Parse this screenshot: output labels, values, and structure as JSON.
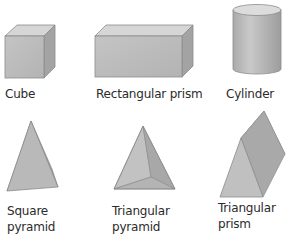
{
  "shapes": [
    {
      "id": "cube",
      "label_lines": [
        "Cube"
      ]
    },
    {
      "id": "rectangular-prism",
      "label_lines": [
        "Rectangular prism"
      ]
    },
    {
      "id": "cylinder",
      "label_lines": [
        "Cylinder"
      ]
    },
    {
      "id": "square-pyramid",
      "label_lines": [
        "Square",
        "pyramid"
      ]
    },
    {
      "id": "triangular-pyramid",
      "label_lines": [
        "Triangular",
        "pyramid"
      ]
    },
    {
      "id": "triangular-prism",
      "label_lines": [
        "Triangular",
        "prism"
      ]
    }
  ],
  "colors": {
    "face_light": "#d9d9d9",
    "face_mid": "#b8b8b8",
    "face_dark": "#9e9e9e",
    "edge": "#8c8c8c",
    "text": "#2b2b2b"
  }
}
